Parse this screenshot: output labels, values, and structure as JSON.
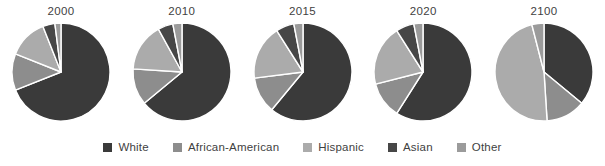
{
  "legend": {
    "items": [
      {
        "label": "White",
        "color": "#3a3a3a"
      },
      {
        "label": "African-American",
        "color": "#8d8d8d"
      },
      {
        "label": "Hispanic",
        "color": "#ababab"
      },
      {
        "label": "Asian",
        "color": "#474747"
      },
      {
        "label": "Other",
        "color": "#9b9b9b"
      }
    ]
  },
  "chart_data": {
    "type": "pie",
    "title": "",
    "xlabel": "",
    "ylabel": "",
    "grid": false,
    "legend_position": "bottom",
    "categories": [
      "White",
      "African-American",
      "Hispanic",
      "Asian",
      "Other"
    ],
    "colors": [
      "#3a3a3a",
      "#8d8d8d",
      "#ababab",
      "#474747",
      "#9b9b9b"
    ],
    "panels": [
      {
        "label": "2000",
        "values": [
          69,
          12,
          13,
          4,
          2
        ],
        "slice_order": [
          "White",
          "African-American",
          "Hispanic",
          "Asian",
          "Other"
        ]
      },
      {
        "label": "2010",
        "values": [
          64,
          12,
          16,
          5,
          3
        ],
        "slice_order": [
          "White",
          "African-American",
          "Hispanic",
          "Asian",
          "Other"
        ]
      },
      {
        "label": "2015",
        "values": [
          61,
          12,
          18,
          6,
          3
        ],
        "slice_order": [
          "White",
          "African-American",
          "Hispanic",
          "Asian",
          "Other"
        ]
      },
      {
        "label": "2020",
        "values": [
          59,
          12,
          20,
          6,
          3
        ],
        "slice_order": [
          "White",
          "African-American",
          "Hispanic",
          "Asian",
          "Other"
        ]
      },
      {
        "label": "2100",
        "values": [
          36,
          13,
          47,
          0,
          4
        ],
        "slice_order": [
          "White",
          "African-American",
          "Hispanic",
          "Asian",
          "Other"
        ]
      }
    ]
  }
}
